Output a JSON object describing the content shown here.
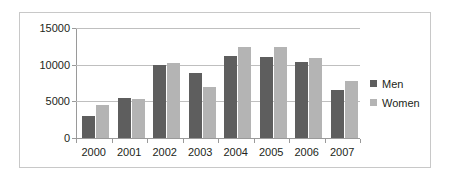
{
  "chart_data": {
    "type": "bar",
    "title": "",
    "xlabel": "",
    "ylabel": "",
    "categories": [
      "2000",
      "2001",
      "2002",
      "2003",
      "2004",
      "2005",
      "2006",
      "2007"
    ],
    "series": [
      {
        "name": "Men",
        "color": "#5e5e5e",
        "values": [
          3000,
          5500,
          9900,
          8900,
          11200,
          11100,
          10300,
          6500
        ]
      },
      {
        "name": "Women",
        "color": "#b4b4b4",
        "values": [
          4500,
          5300,
          10200,
          6900,
          12400,
          12400,
          10900,
          7800
        ]
      }
    ],
    "ylim": [
      0,
      15000
    ],
    "yticks": [
      0,
      5000,
      10000,
      15000
    ],
    "ytick_labels": [
      "0",
      "5000",
      "10000",
      "15000"
    ],
    "grid": true,
    "legend_position": "right",
    "legend": [
      "Men",
      "Women"
    ]
  },
  "colors": {
    "men": "#5e5e5e",
    "women": "#b4b4b4",
    "gridline": "#bfbfbf",
    "axis": "#9a9a9a",
    "frame": "#c8c8c8",
    "text": "#231f20",
    "background": "#ffffff"
  }
}
